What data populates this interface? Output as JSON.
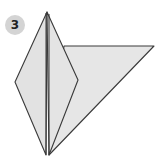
{
  "step": {
    "number": "3"
  },
  "colors": {
    "paper_fill": "#e4e4e4",
    "flap_fill": "#dedede",
    "stroke": "#3a3a3a",
    "badge_fill": "#d4d4d4",
    "badge_text": "#222222",
    "background": "#ffffff"
  },
  "diagram": {
    "kite": {
      "top": [
        47,
        12
      ],
      "left": [
        15,
        82
      ],
      "right": [
        78,
        80
      ],
      "bottom": [
        47,
        155
      ]
    },
    "flap_triangle": {
      "top_left": [
        64,
        46
      ],
      "tip": [
        154,
        46
      ],
      "bottom": [
        49,
        155
      ]
    },
    "center_crease": {
      "lines": [
        [
          [
            46,
            13
          ],
          [
            46,
            155
          ]
        ],
        [
          [
            49,
            13
          ],
          [
            49,
            155
          ]
        ]
      ]
    }
  }
}
